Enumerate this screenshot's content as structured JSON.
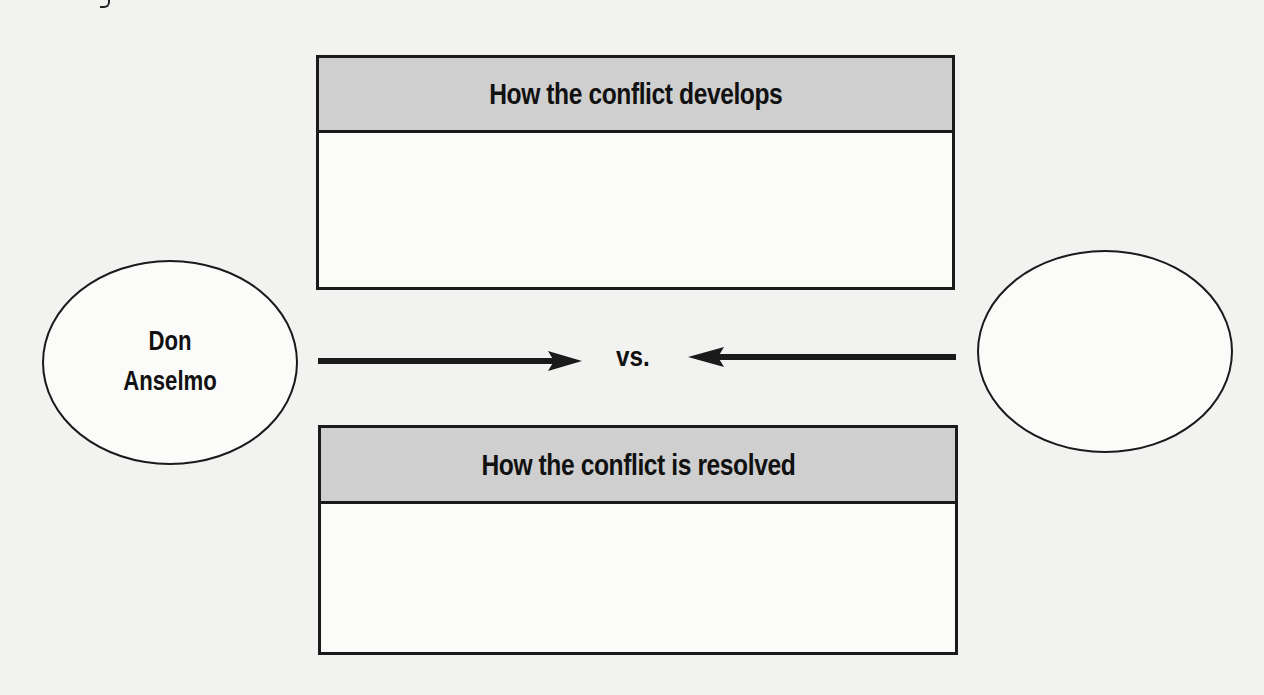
{
  "diagram": {
    "type": "conflict-map",
    "colors": {
      "background": "#f2f2f1",
      "header_fill": "#cfcfcf",
      "stroke": "#1a1a1a"
    },
    "top_box": {
      "title": "How the conflict develops",
      "content": ""
    },
    "bottom_box": {
      "title": "How the conflict is resolved",
      "content": ""
    },
    "left_party": {
      "label_line1": "Don",
      "label_line2": "Anselmo"
    },
    "right_party": {
      "label": ""
    },
    "connector": {
      "label": "vs.",
      "left_arrow": "arrow-right",
      "right_arrow": "arrow-left"
    }
  }
}
